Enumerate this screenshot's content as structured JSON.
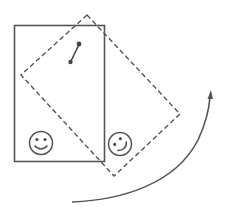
{
  "diagram": {
    "colors": {
      "stroke": "#555555",
      "background": "#ffffff"
    },
    "elements": {
      "original_rectangle": {
        "label": "original position",
        "style": "solid"
      },
      "rotated_rectangle": {
        "label": "rotated position",
        "style": "dashed"
      },
      "pin": {
        "label": "pin"
      },
      "smiley_original": {
        "label": "smiley face (upright)"
      },
      "smiley_rotated": {
        "label": "smiley face (rotated)"
      },
      "rotation_arrow": {
        "label": "counterclockwise rotation arrow"
      }
    }
  }
}
